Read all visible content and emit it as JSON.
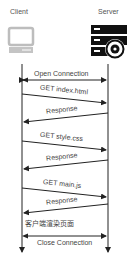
{
  "participants": {
    "client": {
      "label": "Client",
      "icon": "computer-icon"
    },
    "server": {
      "label": "Server",
      "icon": "server-gear-icon"
    }
  },
  "messages": [
    {
      "id": "open",
      "label": "Open Connection",
      "direction": "both"
    },
    {
      "id": "get-index",
      "label": "GET index.html",
      "direction": "client-to-server"
    },
    {
      "id": "resp-1",
      "label": "Response",
      "direction": "server-to-client"
    },
    {
      "id": "get-style",
      "label": "GET style.css",
      "direction": "client-to-server"
    },
    {
      "id": "resp-2",
      "label": "Response",
      "direction": "server-to-client"
    },
    {
      "id": "get-main",
      "label": "GET main.js",
      "direction": "client-to-server"
    },
    {
      "id": "resp-3",
      "label": "Response",
      "direction": "server-to-client"
    },
    {
      "id": "close",
      "label": "Close Connection",
      "direction": "both"
    }
  ],
  "notes": {
    "client_render": "客户端渲染页面"
  },
  "colors": {
    "line": "#222222",
    "icon_client": "#bfbfbf",
    "icon_server": "#111111"
  }
}
